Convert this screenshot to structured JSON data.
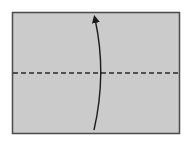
{
  "diagram": {
    "type": "origami-fold-step",
    "paper": {
      "x": 12,
      "y": 12,
      "width": 168,
      "height": 122,
      "fill": "#cbcbcb",
      "stroke": "#4a4a4a"
    },
    "fold_line": {
      "kind": "valley-fold",
      "y": 73,
      "x1": 12,
      "x2": 180,
      "stroke": "#2a2a2a",
      "dash": "5,3"
    },
    "arrow": {
      "direction": "up",
      "meaning": "fold bottom edge up to top",
      "path": "M 94 130 Q 107 73 95 17",
      "stroke": "#1a1a1a"
    }
  }
}
